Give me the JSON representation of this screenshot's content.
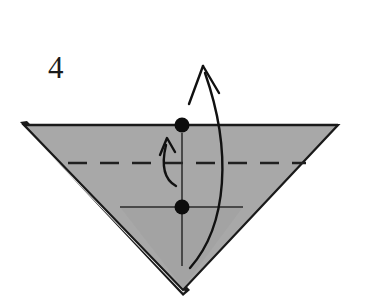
{
  "figure": {
    "kind": "origami-fold-diagram",
    "step_label": "4",
    "background_color": "#ffffff",
    "width": 368,
    "height": 307
  },
  "colors": {
    "paper_fill": "#a8a8a8",
    "paper_fill_shadow": "#9d9d9d",
    "outline": "#1a1a1a",
    "crease_line": "#2a2a2a",
    "dashed_fold": "#202020",
    "dot": "#0d0d0d",
    "arrow": "#111111",
    "white_sliver": "#ffffff"
  },
  "shapes": {
    "paper_triangle": {
      "name": "downward-pointing-triangle",
      "points": "24,125 338,125 183,290",
      "fill": "#a8a8a8",
      "stroke": "#1a1a1a",
      "stroke_width": 2.2
    },
    "layer_edge_left": {
      "name": "left-layered-edge",
      "from": [
        26,
        127
      ],
      "to": [
        181,
        292
      ],
      "offset": 5
    },
    "layer_edge_bottom": {
      "name": "bottom-apex-layered-edge",
      "from": [
        175,
        284
      ],
      "to": [
        190,
        296
      ]
    }
  },
  "creases": {
    "valley_fold_dashed": {
      "label": "valley-fold-dashed-line",
      "y": 163,
      "x_start": 68,
      "x_end": 306,
      "dash_pattern": "19 13",
      "stroke_width": 2.4
    },
    "horizontal_crease": {
      "label": "horizontal-crease-line",
      "y": 207,
      "x_start": 120,
      "x_end": 243,
      "stroke_width": 1.5
    },
    "vertical_crease": {
      "label": "vertical-center-line",
      "x": 182,
      "y_start": 133,
      "y_end": 266,
      "stroke_width": 1.5
    }
  },
  "markers": {
    "dots": [
      {
        "name": "top-reference-dot",
        "cx": 182,
        "cy": 125,
        "r": 7.5
      },
      {
        "name": "lower-reference-dot",
        "cx": 182,
        "cy": 207,
        "r": 7.5
      }
    ]
  },
  "arrows": {
    "small_fold_arrow": {
      "name": "small-curved-fold-arrow",
      "path": "M 176,186 C 165,180 161,166 166,145",
      "head": "M 160,155 L 167,138 L 175,152",
      "stroke_width": 2.4
    },
    "large_fold_arrow": {
      "name": "large-curved-fold-arrow",
      "path": "M 190,268 C 228,225 232,150 205,73",
      "head_left": "M 189,104 L 203,66",
      "head_right": "M 219,93 L 203,66",
      "stroke_width": 2.4
    }
  },
  "labels": {
    "step_number": {
      "name": "step-number",
      "text": "4",
      "x": 48,
      "y": 78
    }
  }
}
